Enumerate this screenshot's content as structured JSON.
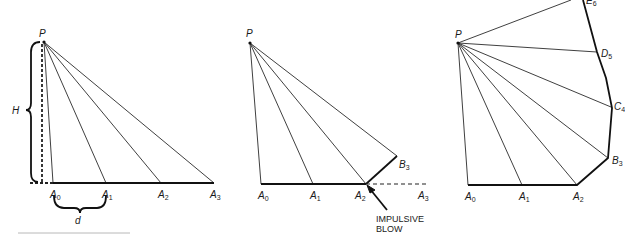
{
  "figure": {
    "colors": {
      "ink": "#1a1a1a",
      "background": "#ffffff"
    },
    "panel1": {
      "apex": "P",
      "height_label": "H",
      "spacing_label": "d",
      "base_points": [
        {
          "letter": "A",
          "sub": "0"
        },
        {
          "letter": "A",
          "sub": "1"
        },
        {
          "letter": "A",
          "sub": "2"
        },
        {
          "letter": "A",
          "sub": "3"
        }
      ]
    },
    "panel2": {
      "apex": "P",
      "base_points": [
        {
          "letter": "A",
          "sub": "0"
        },
        {
          "letter": "A",
          "sub": "1"
        },
        {
          "letter": "A",
          "sub": "2"
        },
        {
          "letter": "A",
          "sub": "3"
        }
      ],
      "deflected_point": {
        "letter": "B",
        "sub": "3"
      },
      "annotation_line1": "IMPULSIVE",
      "annotation_line2": "BLOW"
    },
    "panel3": {
      "apex": "P",
      "base_points": [
        {
          "letter": "A",
          "sub": "0"
        },
        {
          "letter": "A",
          "sub": "1"
        },
        {
          "letter": "A",
          "sub": "2"
        }
      ],
      "polygon_points": [
        {
          "letter": "B",
          "sub": "3"
        },
        {
          "letter": "C",
          "sub": "4"
        },
        {
          "letter": "D",
          "sub": "5"
        },
        {
          "letter": "E",
          "sub": "6"
        }
      ]
    }
  }
}
